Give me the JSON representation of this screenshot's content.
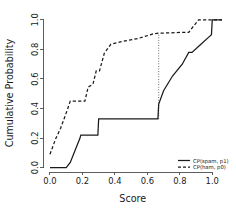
{
  "chart_data": {
    "type": "line",
    "title": "",
    "xlabel": "Score",
    "ylabel": "Cumulative Probability",
    "xlim": [
      -0.04,
      1.06
    ],
    "ylim": [
      -0.03,
      1.04
    ],
    "grid": false,
    "legend_position": "bottom-right",
    "xticks": [
      "0.0",
      "0.2",
      "0.4",
      "0.6",
      "0.8",
      "1.0"
    ],
    "xtick_values": [
      0.0,
      0.2,
      0.4,
      0.6,
      0.8,
      1.0
    ],
    "yticks": [
      "0.0",
      "0.2",
      "0.4",
      "0.6",
      "0.8",
      "1.0"
    ],
    "ytick_values": [
      0.0,
      0.2,
      0.4,
      0.6,
      0.8,
      1.0
    ],
    "series": [
      {
        "name": "CP(spam, p1)",
        "style": "solid",
        "color": "#1a1a1a",
        "x": [
          0.0,
          0.1,
          0.125,
          0.185,
          0.19,
          0.295,
          0.3,
          0.665,
          0.67,
          0.7,
          0.755,
          0.815,
          0.855,
          0.875,
          0.925,
          0.975,
          0.995,
          1.0,
          1.06
        ],
        "y": [
          0.0,
          0.0,
          0.035,
          0.2,
          0.22,
          0.22,
          0.33,
          0.33,
          0.43,
          0.52,
          0.62,
          0.7,
          0.78,
          0.78,
          0.83,
          0.88,
          0.9,
          1.0,
          1.0
        ]
      },
      {
        "name": "CP(ham, p0)",
        "style": "dashed",
        "color": "#1a1a1a",
        "x": [
          0.0,
          0.035,
          0.065,
          0.105,
          0.125,
          0.215,
          0.235,
          0.265,
          0.285,
          0.305,
          0.335,
          0.375,
          0.45,
          0.545,
          0.635,
          0.67,
          0.8,
          0.855,
          0.875,
          0.915,
          0.945,
          1.0,
          1.06
        ],
        "y": [
          0.09,
          0.195,
          0.265,
          0.385,
          0.45,
          0.45,
          0.545,
          0.565,
          0.655,
          0.655,
          0.775,
          0.835,
          0.855,
          0.875,
          0.905,
          0.91,
          0.915,
          0.915,
          0.945,
          1.0,
          1.0,
          1.0,
          1.0
        ]
      }
    ],
    "annotations": [
      {
        "type": "vertical-dotted-connector",
        "x": 0.67,
        "y_from": 0.33,
        "y_to": 0.91
      }
    ],
    "legend": [
      {
        "label": "CP(spam, p1)",
        "style": "solid"
      },
      {
        "label": "CP(ham, p0)",
        "style": "dashed"
      }
    ]
  }
}
